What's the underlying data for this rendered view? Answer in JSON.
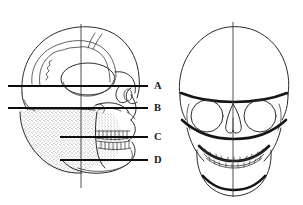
{
  "figure": {
    "background_color": "#ffffff",
    "line_color": "#2b2b2b",
    "label_color": "#1a1a1a",
    "width": 303,
    "height": 205
  },
  "panels": [
    {
      "id": "lateral-skull",
      "name": "lateral-skull-view",
      "description": "Lateral (side profile) view of human skull facing right",
      "center_x": 80,
      "vertical_axis_x": 81,
      "features": [
        "cranial vault",
        "cranial suture contours",
        "temporal line",
        "orbit",
        "zygomatic arch",
        "nasal bone",
        "maxilla with teeth",
        "mandible",
        "external auditory meatus",
        "stippled masticatory region"
      ]
    },
    {
      "id": "frontal-skull",
      "name": "frontal-skull-view",
      "description": "Frontal (anterior) view of human skull",
      "center_x": 233,
      "vertical_axis_x": 233,
      "features": [
        "cranial vault",
        "supraorbital ridge",
        "left orbit",
        "right orbit",
        "nasal aperture",
        "maxillary teeth",
        "mandibular teeth",
        "mandible body",
        "mental protuberance"
      ]
    }
  ],
  "reference_lines": [
    {
      "id": "line-a",
      "label": "A",
      "y": 86,
      "x_start": 8,
      "x_end": 148,
      "label_x": 155,
      "label_y": 86,
      "name": "reference-plane-a"
    },
    {
      "id": "line-b",
      "label": "B",
      "y": 108,
      "x_start": 8,
      "x_end": 148,
      "label_x": 155,
      "label_y": 108,
      "name": "reference-plane-b"
    },
    {
      "id": "line-c",
      "label": "C",
      "y": 137,
      "x_start": 60,
      "x_end": 148,
      "label_x": 155,
      "label_y": 137,
      "name": "reference-plane-c"
    },
    {
      "id": "line-d",
      "label": "D",
      "y": 160,
      "x_start": 60,
      "x_end": 148,
      "label_x": 155,
      "label_y": 160,
      "name": "reference-plane-d"
    }
  ],
  "labels": [
    {
      "text": "A",
      "name": "plane-label-a"
    },
    {
      "text": "B",
      "name": "plane-label-b"
    },
    {
      "text": "C",
      "name": "plane-label-c"
    },
    {
      "text": "D",
      "name": "plane-label-d"
    }
  ]
}
